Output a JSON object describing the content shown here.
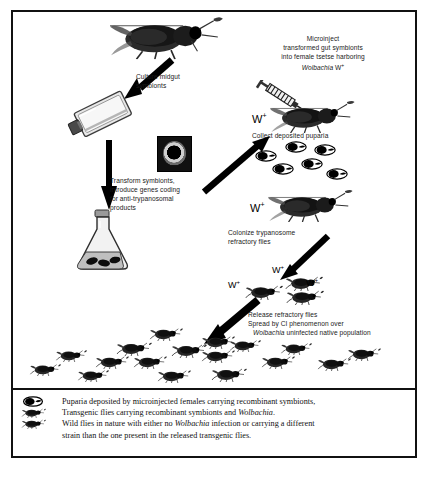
{
  "figure": {
    "type": "scientific-flow-diagram"
  },
  "steps": {
    "culture": {
      "label_line1": "Culture midgut",
      "label_line2": "symbionts"
    },
    "transform": {
      "label_line1": "Transform symbionts,",
      "label_line2": "introduce genes coding",
      "label_line3": "for anti-trypanosomal",
      "label_line4": "products"
    },
    "microinject": {
      "label_line1": "Microinject",
      "label_line2": "transformed gut symbionts",
      "label_line3": "into female tsetse harboring",
      "label_line4_italic": "Wolbachia",
      "label_line4_rest": " W",
      "label_line4_sup": "+"
    },
    "collect": {
      "label": "Collect deposited puparia"
    },
    "colonize": {
      "label_line1": "Colonize trypanosome",
      "label_line2": "refractory flies"
    },
    "release": {
      "label_line1": "Release refractory flies",
      "label_line2": "Spread by CI phenomenon over",
      "label_line3_italic": "Wolbachia",
      "label_line3_rest": " uninfected native population"
    }
  },
  "markers": {
    "w_plus_base": "W",
    "w_plus_sup": "+",
    "instances": [
      {
        "id": "w-injected-female",
        "x": 252,
        "y": 115
      },
      {
        "id": "w-colonize-fly",
        "x": 252,
        "y": 203
      },
      {
        "id": "w-release-top",
        "x": 273,
        "y": 273
      },
      {
        "id": "w-release-left",
        "x": 232,
        "y": 288
      },
      {
        "id": "w-release-right",
        "x": 308,
        "y": 284
      }
    ]
  },
  "puparia": {
    "count": 6,
    "positions": [
      {
        "x": 260,
        "y": 152
      },
      {
        "x": 289,
        "y": 143
      },
      {
        "x": 318,
        "y": 146
      },
      {
        "x": 276,
        "y": 165
      },
      {
        "x": 305,
        "y": 160
      },
      {
        "x": 330,
        "y": 170
      }
    ]
  },
  "swarm": {
    "description": "wild native tsetse population",
    "count": 17,
    "positions": [
      {
        "x": 148,
        "y": 330,
        "s": 1.0
      },
      {
        "x": 200,
        "y": 338,
        "s": 1.0
      },
      {
        "x": 116,
        "y": 344,
        "s": 1.1
      },
      {
        "x": 172,
        "y": 346,
        "s": 1.05
      },
      {
        "x": 230,
        "y": 342,
        "s": 0.95
      },
      {
        "x": 96,
        "y": 358,
        "s": 1.0
      },
      {
        "x": 134,
        "y": 358,
        "s": 1.0
      },
      {
        "x": 202,
        "y": 352,
        "s": 1.0
      },
      {
        "x": 262,
        "y": 358,
        "s": 1.0
      },
      {
        "x": 318,
        "y": 360,
        "s": 1.0
      },
      {
        "x": 348,
        "y": 350,
        "s": 1.0
      },
      {
        "x": 158,
        "y": 372,
        "s": 1.0
      },
      {
        "x": 212,
        "y": 370,
        "s": 1.05
      },
      {
        "x": 56,
        "y": 352,
        "s": 0.95
      },
      {
        "x": 30,
        "y": 366,
        "s": 0.95
      },
      {
        "x": 78,
        "y": 372,
        "s": 0.95
      },
      {
        "x": 282,
        "y": 345,
        "s": 0.9
      }
    ]
  },
  "release_cluster": {
    "count": 3,
    "positions": [
      {
        "x": 286,
        "y": 281
      },
      {
        "x": 246,
        "y": 289
      },
      {
        "x": 289,
        "y": 294
      }
    ]
  },
  "legend": {
    "entries": [
      {
        "icon": "puparium-icon",
        "text_pre": "Puparia deposited by microinjected females carrying recombinant symbionts,",
        "italic": "",
        "text_post": ""
      },
      {
        "icon": "transgenic-fly-icon",
        "text_pre": "Transgenic flies carrying recombinant symbionts and ",
        "italic": "Wolbachia",
        "text_post": "."
      },
      {
        "icon": "wild-fly-icon",
        "text_pre": "Wild flies in nature with either no ",
        "italic": "Wolbachia",
        "text_post": " infection or carrying a different"
      }
    ],
    "continuation": "strain than the one present in the released transgenic flies."
  },
  "colors": {
    "frame": "#111111",
    "ink": "#1a1a1a",
    "fly_body": "#2a2a2a",
    "paper": "#ffffff"
  }
}
